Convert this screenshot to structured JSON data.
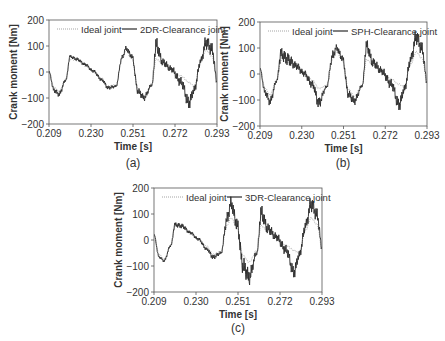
{
  "figure": {
    "captions": [
      "(a)",
      "(b)",
      "(c)"
    ]
  },
  "chart_data": [
    {
      "type": "line",
      "panel": "a",
      "caption": "(a)",
      "title": "",
      "xlabel": "Time [s]",
      "ylabel": "Crank moment [Nm]",
      "xlim": [
        0.209,
        0.293
      ],
      "ylim": [
        -200,
        200
      ],
      "xticks": [
        "0.209",
        "0.230",
        "0.251",
        "0.272",
        "0.293"
      ],
      "yticks": [
        "200",
        "100",
        "0",
        "−100",
        "−200"
      ],
      "grid": false,
      "legend": {
        "position": "top-inside",
        "entries": [
          "Ideal joint",
          "2DR-Clearance joint"
        ]
      },
      "series": [
        {
          "name": "Ideal joint",
          "style": "dotted",
          "x": [
            0.209,
            0.2115,
            0.214,
            0.2175,
            0.2195,
            0.223,
            0.227,
            0.231,
            0.2355,
            0.2385,
            0.2425,
            0.2455,
            0.2475,
            0.2505,
            0.2535,
            0.2565,
            0.2605,
            0.2625,
            0.266,
            0.27,
            0.275,
            0.279,
            0.2815,
            0.285,
            0.2875,
            0.2905,
            0.293
          ],
          "y": [
            0,
            -60,
            -75,
            -25,
            50,
            45,
            25,
            5,
            -25,
            -55,
            -50,
            50,
            80,
            50,
            -65,
            -90,
            -45,
            50,
            30,
            10,
            -15,
            -40,
            -55,
            40,
            85,
            60,
            -30
          ]
        },
        {
          "name": "2DR-Clearance joint",
          "style": "solid",
          "x": [
            0.209,
            0.2115,
            0.214,
            0.2175,
            0.2195,
            0.223,
            0.227,
            0.231,
            0.2355,
            0.2385,
            0.2425,
            0.2455,
            0.2475,
            0.2505,
            0.2535,
            0.2565,
            0.2605,
            0.2625,
            0.266,
            0.27,
            0.275,
            0.279,
            0.2815,
            0.285,
            0.2875,
            0.2905,
            0.293
          ],
          "y": [
            0,
            -70,
            -85,
            -30,
            60,
            50,
            30,
            5,
            -30,
            -60,
            -55,
            55,
            90,
            60,
            -75,
            -100,
            -50,
            100,
            35,
            10,
            -40,
            -120,
            -70,
            45,
            115,
            90,
            -35
          ],
          "oscillation_amplitude": [
            5,
            15,
            15,
            8,
            10,
            10,
            10,
            10,
            10,
            12,
            8,
            15,
            15,
            15,
            20,
            20,
            10,
            50,
            25,
            20,
            30,
            40,
            25,
            20,
            40,
            40,
            20
          ]
        }
      ]
    },
    {
      "type": "line",
      "panel": "b",
      "caption": "(b)",
      "title": "",
      "xlabel": "Time [s]",
      "ylabel": "Crank moment [Nm]",
      "xlim": [
        0.209,
        0.293
      ],
      "ylim": [
        -200,
        200
      ],
      "xticks": [
        "0.209",
        "0.230",
        "0.251",
        "0.272",
        "0.293"
      ],
      "yticks": [
        "200",
        "100",
        "0",
        "−100",
        "−200"
      ],
      "grid": false,
      "legend": {
        "position": "top-inside",
        "entries": [
          "Ideal joint",
          "SPH-Clearance joint"
        ]
      },
      "series": [
        {
          "name": "Ideal joint",
          "style": "dotted",
          "x": [
            0.209,
            0.2115,
            0.214,
            0.2175,
            0.2195,
            0.223,
            0.227,
            0.231,
            0.2355,
            0.2385,
            0.2425,
            0.2455,
            0.2475,
            0.2505,
            0.2535,
            0.2565,
            0.2605,
            0.2625,
            0.266,
            0.27,
            0.275,
            0.279,
            0.2815,
            0.285,
            0.2875,
            0.2905,
            0.293
          ],
          "y": [
            20,
            -55,
            -80,
            -20,
            55,
            45,
            25,
            5,
            -25,
            -55,
            -45,
            55,
            85,
            50,
            -60,
            -85,
            -40,
            55,
            35,
            10,
            -20,
            -40,
            -50,
            40,
            85,
            60,
            -25
          ]
        },
        {
          "name": "SPH-Clearance joint",
          "style": "solid",
          "x": [
            0.209,
            0.2115,
            0.214,
            0.2175,
            0.2195,
            0.223,
            0.227,
            0.231,
            0.2355,
            0.2385,
            0.2425,
            0.2455,
            0.2475,
            0.2505,
            0.2535,
            0.2565,
            0.2605,
            0.2625,
            0.266,
            0.27,
            0.275,
            0.279,
            0.2815,
            0.285,
            0.2875,
            0.2905,
            0.293
          ],
          "y": [
            20,
            -70,
            -105,
            -25,
            80,
            60,
            35,
            5,
            -40,
            -110,
            -50,
            70,
            100,
            60,
            -80,
            -105,
            -45,
            105,
            40,
            10,
            -40,
            -120,
            -60,
            60,
            145,
            100,
            -30
          ],
          "oscillation_amplitude": [
            5,
            20,
            25,
            10,
            40,
            40,
            25,
            20,
            25,
            35,
            10,
            30,
            20,
            20,
            25,
            25,
            10,
            40,
            30,
            25,
            30,
            40,
            25,
            30,
            45,
            40,
            20
          ]
        }
      ]
    },
    {
      "type": "line",
      "panel": "c",
      "caption": "(c)",
      "title": "",
      "xlabel": "Time [s]",
      "ylabel": "Crank moment [Nm]",
      "xlim": [
        0.209,
        0.293
      ],
      "ylim": [
        -200,
        200
      ],
      "xticks": [
        "0.209",
        "0.230",
        "0.251",
        "0.272",
        "0.293"
      ],
      "yticks": [
        "200",
        "100",
        "0",
        "−100",
        "−200"
      ],
      "grid": false,
      "legend": {
        "position": "top-inside",
        "entries": [
          "Ideal joint",
          "3DR-Clearance joint"
        ]
      },
      "series": [
        {
          "name": "Ideal joint",
          "style": "dotted",
          "x": [
            0.209,
            0.2115,
            0.214,
            0.2175,
            0.2195,
            0.223,
            0.227,
            0.231,
            0.2355,
            0.2385,
            0.2425,
            0.2455,
            0.2475,
            0.2505,
            0.2535,
            0.2565,
            0.2605,
            0.2625,
            0.266,
            0.27,
            0.275,
            0.279,
            0.2815,
            0.285,
            0.2875,
            0.2905,
            0.293
          ],
          "y": [
            20,
            -55,
            -75,
            -20,
            55,
            50,
            25,
            5,
            -25,
            -55,
            -45,
            55,
            85,
            50,
            -60,
            -85,
            -40,
            55,
            35,
            10,
            -20,
            -40,
            -50,
            40,
            85,
            60,
            -30
          ]
        },
        {
          "name": "3DR-Clearance joint",
          "style": "solid",
          "x": [
            0.209,
            0.2115,
            0.214,
            0.2175,
            0.2195,
            0.223,
            0.227,
            0.231,
            0.2355,
            0.2385,
            0.2425,
            0.2455,
            0.2475,
            0.2505,
            0.2535,
            0.2565,
            0.2605,
            0.2625,
            0.266,
            0.27,
            0.275,
            0.279,
            0.2815,
            0.285,
            0.2875,
            0.2905,
            0.293
          ],
          "y": [
            20,
            -65,
            -80,
            -20,
            60,
            55,
            30,
            5,
            -35,
            -65,
            -50,
            80,
            140,
            60,
            -100,
            -145,
            -50,
            100,
            40,
            10,
            -40,
            -125,
            -60,
            60,
            140,
            100,
            -30
          ],
          "oscillation_amplitude": [
            3,
            8,
            8,
            8,
            15,
            15,
            10,
            10,
            10,
            15,
            10,
            40,
            40,
            40,
            50,
            50,
            15,
            50,
            35,
            25,
            30,
            40,
            25,
            30,
            45,
            40,
            20
          ]
        }
      ]
    }
  ],
  "panels": [
    {
      "id": "a",
      "box": [
        49,
        20,
        217,
        124
      ]
    },
    {
      "id": "b",
      "box": [
        260,
        22,
        427,
        126
      ]
    },
    {
      "id": "c",
      "box": [
        154,
        188,
        322,
        292
      ]
    }
  ]
}
